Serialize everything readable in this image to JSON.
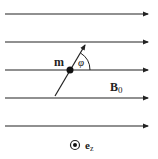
{
  "labels": {
    "moment": "m",
    "angle": "φ",
    "field": "B",
    "field_sub": "0",
    "unit_vector": "e",
    "unit_sub": "z"
  },
  "field_line_count": 5,
  "colors": {
    "ink": "#222222"
  }
}
